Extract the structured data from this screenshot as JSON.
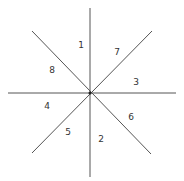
{
  "diagram": {
    "type": "8-sector radial division",
    "line_color": "#555555",
    "center": [
      90,
      93
    ],
    "lines": [
      {
        "x1": 90,
        "y1": 8,
        "x2": 90,
        "y2": 177
      },
      {
        "x1": 8,
        "y1": 93,
        "x2": 176,
        "y2": 93
      },
      {
        "x1": 32,
        "y1": 31,
        "x2": 151,
        "y2": 154
      },
      {
        "x1": 152,
        "y1": 31,
        "x2": 32,
        "y2": 153
      }
    ],
    "labels": [
      {
        "text": "1",
        "x": 81,
        "y": 45
      },
      {
        "text": "7",
        "x": 117,
        "y": 52
      },
      {
        "text": "8",
        "x": 52,
        "y": 70
      },
      {
        "text": "3",
        "x": 136,
        "y": 82
      },
      {
        "text": "4",
        "x": 47,
        "y": 106
      },
      {
        "text": "6",
        "x": 131,
        "y": 117
      },
      {
        "text": "5",
        "x": 68,
        "y": 132
      },
      {
        "text": "2",
        "x": 101,
        "y": 139
      }
    ]
  }
}
